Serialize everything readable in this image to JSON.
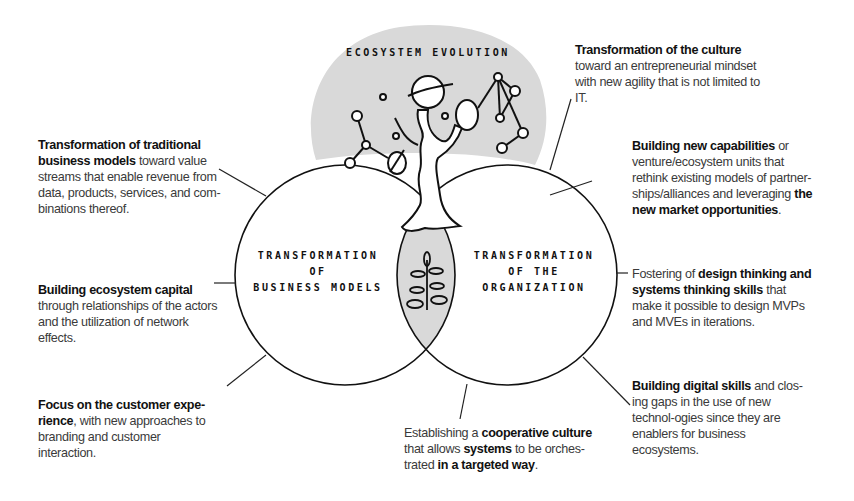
{
  "title": "Ecosystem Evolution",
  "center": {
    "top_label": "ECOSYSTEM EVOLUTION",
    "left_circle": [
      "TRANSFORMATION",
      "OF",
      "BUSINESS MODELS"
    ],
    "right_circle": [
      "TRANSFORMATION",
      "OF THE",
      "ORGANIZATION"
    ],
    "colors": {
      "fill_grey": "#d9d9d9",
      "stroke": "#111111",
      "text": "#3a3a3a"
    }
  },
  "notes": {
    "business_models": {
      "bold": "Transformation of traditional business models",
      "rest": " toward value streams that enable revenue from data, products, services, and com-binations thereof."
    },
    "ecosystem_capital": {
      "bold": "Building ecosystem capital",
      "rest": " through relationships of the actors and the utilization of network effects."
    },
    "customer_experience": {
      "bold": "Focus on the customer expe-rience",
      "rest": ", with new approaches to branding and customer interaction."
    },
    "culture": {
      "bold": "Transformation of the culture",
      "rest": " toward an entrepreneurial mindset with new agility that is not limited to IT."
    },
    "capabilities": {
      "bold1": "Building new capabilities",
      "mid": " or venture/ecosystem units that rethink existing models of partner-ships/alliances and leveraging ",
      "bold2": "the new market opportunities",
      "end": "."
    },
    "design_thinking": {
      "pre": "Fostering of ",
      "bold": "design thinking and systems thinking skills",
      "rest": " that make it possible to design MVPs and MVEs in iterations."
    },
    "digital_skills": {
      "bold": "Building digital skills",
      "rest": " and clos-ing gaps in the use of new technol-ogies since they are enablers for business ecosystems."
    },
    "cooperative": {
      "pre": "Establishing a ",
      "bold1": "cooperative culture",
      "mid": " that allows ",
      "bold2": "systems",
      "mid2": " to be orches-trated ",
      "bold3": "in a targeted way",
      "end": "."
    }
  }
}
